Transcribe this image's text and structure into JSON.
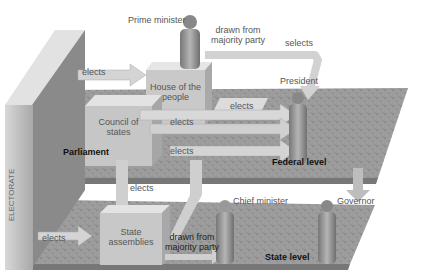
{
  "diagram": {
    "electorate_label": "ELECTORATE",
    "levels": {
      "federal": "Federal level",
      "state": "State level",
      "parliament": "Parliament"
    },
    "bodies": {
      "house_of_people": "House of the\npeople",
      "house_of_people_l1": "House of the",
      "house_of_people_l2": "people",
      "council_l1": "Council of",
      "council_l2": "states",
      "state_assemblies_l1": "State",
      "state_assemblies_l2": "assemblies"
    },
    "figures": {
      "prime_minister": "Prime minister",
      "president": "President",
      "chief_minister": "Chief minister",
      "governor": "Governor"
    },
    "arrows": {
      "electorate_to_house": "elects",
      "house_to_president": "elects",
      "council_to_president": "elects",
      "lower_to_president": "elects",
      "state_to_council": "elects",
      "electorate_to_state": "elects",
      "pm_drawn_l1": "drawn from",
      "pm_drawn_l2": "majority party",
      "cm_drawn_l1": "drawn from",
      "cm_drawn_l2": "majority party",
      "selects": "selects"
    },
    "colors": {
      "background": "#ffffff",
      "box_face": "#c8c8c8",
      "arrow": "#d6d6d6",
      "platform": "#9a9a9a",
      "figure": "#8f8f8f",
      "text": "#555555"
    }
  }
}
